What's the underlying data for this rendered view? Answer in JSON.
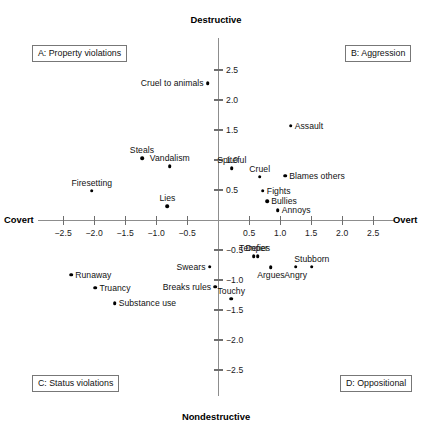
{
  "chart_data": {
    "type": "scatter",
    "title": "",
    "xlabel": "",
    "ylabel": "",
    "xlim": [
      -2.9,
      2.9
    ],
    "ylim": [
      -2.9,
      2.9
    ],
    "grid": false,
    "legend": "none",
    "axis_poles": {
      "top": "Destructive",
      "bottom": "Nondestructive",
      "left": "Covert",
      "right": "Overt"
    },
    "xticks": [
      -2.5,
      -2.0,
      -1.5,
      -1.0,
      -0.5,
      0.5,
      1.0,
      1.5,
      2.0,
      2.5
    ],
    "xtick_labels": [
      "−2.5",
      "−2.0",
      "−1.5",
      "−1.0",
      "−0.5",
      "0.5",
      "1.0",
      "1.5",
      "2.0",
      "2.5"
    ],
    "yticks": [
      2.5,
      2.0,
      1.5,
      1.0,
      0.5,
      -0.5,
      -1.0,
      -1.5,
      -2.0,
      -2.5
    ],
    "ytick_labels": [
      "2.5",
      "2.0",
      "1.5",
      "1.0",
      "0.5",
      "−0.5",
      "−1.0",
      "−1.5",
      "−2.0",
      "−2.5"
    ],
    "quadrant_labels": [
      {
        "id": "A",
        "text": "A: Property violations",
        "quadrant": "top-left"
      },
      {
        "id": "B",
        "text": "B: Aggression",
        "quadrant": "top-right"
      },
      {
        "id": "C",
        "text": "C: Status violations",
        "quadrant": "bottom-left"
      },
      {
        "id": "D",
        "text": "D: Oppositional",
        "quadrant": "bottom-right"
      }
    ],
    "points": [
      {
        "label": "Cruel to animals",
        "x": -0.17,
        "y": 2.28,
        "label_pos": "left"
      },
      {
        "label": "Assault",
        "x": 1.17,
        "y": 1.57,
        "label_pos": "right"
      },
      {
        "label": "Steals",
        "x": -1.23,
        "y": 1.03,
        "label_pos": "above"
      },
      {
        "label": "Vandalism",
        "x": -0.78,
        "y": 0.9,
        "label_pos": "above"
      },
      {
        "label": "Spiteful",
        "x": 0.22,
        "y": 0.86,
        "label_pos": "above"
      },
      {
        "label": "Cruel",
        "x": 0.67,
        "y": 0.72,
        "label_pos": "above"
      },
      {
        "label": "Blames others",
        "x": 1.08,
        "y": 0.74,
        "label_pos": "right"
      },
      {
        "label": "Firesetting",
        "x": -2.04,
        "y": 0.49,
        "label_pos": "above"
      },
      {
        "label": "Fights",
        "x": 0.72,
        "y": 0.49,
        "label_pos": "right"
      },
      {
        "label": "Bullies",
        "x": 0.79,
        "y": 0.31,
        "label_pos": "right"
      },
      {
        "label": "Lies",
        "x": -0.82,
        "y": 0.23,
        "label_pos": "above"
      },
      {
        "label": "Annoys",
        "x": 0.96,
        "y": 0.16,
        "label_pos": "right"
      },
      {
        "label": "Temper",
        "x": 0.57,
        "y": -0.6,
        "label_pos": "above"
      },
      {
        "label": "Defies",
        "x": 0.64,
        "y": -0.6,
        "label_pos": "above"
      },
      {
        "label": "Swears",
        "x": -0.14,
        "y": -0.78,
        "label_pos": "left"
      },
      {
        "label": "Argues",
        "x": 0.85,
        "y": -0.79,
        "label_pos": "below"
      },
      {
        "label": "Angry",
        "x": 1.25,
        "y": -0.78,
        "label_pos": "below"
      },
      {
        "label": "Stubborn",
        "x": 1.51,
        "y": -0.78,
        "label_pos": "above"
      },
      {
        "label": "Runaway",
        "x": -2.37,
        "y": -0.91,
        "label_pos": "right"
      },
      {
        "label": "Truancy",
        "x": -1.98,
        "y": -1.13,
        "label_pos": "right"
      },
      {
        "label": "Breaks rules",
        "x": -0.05,
        "y": -1.11,
        "label_pos": "left"
      },
      {
        "label": "Substance use",
        "x": -1.67,
        "y": -1.39,
        "label_pos": "right"
      },
      {
        "label": "Touchy",
        "x": 0.21,
        "y": -1.31,
        "label_pos": "above"
      }
    ]
  },
  "colors": {
    "point": "#000000",
    "axis": "#8d8d8d",
    "text": "#111111",
    "box_border": "#777777",
    "background": "#ffffff"
  }
}
